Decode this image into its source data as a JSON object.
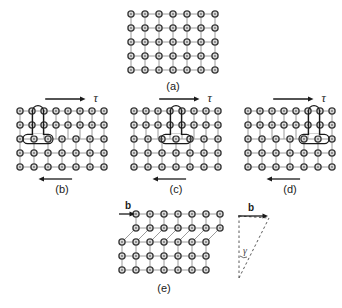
{
  "figure": {
    "background_color": "#ffffff",
    "atom_ring_color": "#3a3a3a",
    "atom_fill_color": "#d9d9d9",
    "bond_color": "#9a9a9a",
    "marker_color": "#1a1a1a",
    "label_color": "#1a1a1a"
  },
  "panels": [
    {
      "id": "a",
      "label": "(a)",
      "caption_label": "(a)",
      "description": "perfect-lattice",
      "origin": {
        "x": 131,
        "y": 14
      },
      "spacing": 14,
      "cols": 7,
      "rows": 5,
      "has_dislocation": false,
      "has_tau": false,
      "has_step": false
    },
    {
      "id": "b",
      "label": "(b)",
      "caption_label": "(b)",
      "description": "dislocation-at-left",
      "origin": {
        "x": 20,
        "y": 111
      },
      "spacing": 14,
      "cols": 7,
      "rows": 5,
      "has_dislocation": true,
      "dislocation_column": 1,
      "half_plane_top_row": 0,
      "half_plane_bottom_row": 2,
      "has_tau": true,
      "tau_symbol": "τ",
      "has_step": false
    },
    {
      "id": "c",
      "label": "(c)",
      "caption_label": "(c)",
      "description": "dislocation-at-center",
      "origin": {
        "x": 134,
        "y": 111
      },
      "spacing": 14,
      "cols": 7,
      "rows": 5,
      "has_dislocation": true,
      "dislocation_column": 3,
      "half_plane_top_row": 0,
      "half_plane_bottom_row": 2,
      "has_tau": true,
      "tau_symbol": "τ",
      "has_step": false
    },
    {
      "id": "d",
      "label": "(d)",
      "caption_label": "(d)",
      "description": "dislocation-at-right",
      "origin": {
        "x": 248,
        "y": 111
      },
      "spacing": 14,
      "cols": 7,
      "rows": 5,
      "has_dislocation": true,
      "dislocation_column": 5,
      "half_plane_top_row": 0,
      "half_plane_bottom_row": 2,
      "has_tau": true,
      "tau_symbol": "τ",
      "has_step": false
    },
    {
      "id": "e",
      "label": "(e)",
      "caption_label": "(e)",
      "description": "slipped-crystal-with-step",
      "origin": {
        "x": 122,
        "y": 214
      },
      "spacing": 14,
      "cols": 7,
      "rows": 5,
      "has_dislocation": false,
      "has_tau": false,
      "has_step": true,
      "step_offset_rows": 2,
      "burgers_symbol": "b"
    }
  ],
  "annotations": {
    "tau_symbol": "τ",
    "burgers_symbol": "b",
    "shear_angle_symbol": "γ",
    "top_arrow_direction": "right",
    "bottom_arrow_direction": "left"
  },
  "shear_inset": {
    "name": "shear-strain-inset",
    "burgers_label": "b",
    "angle_label": "γ",
    "origin": {
      "x": 239,
      "y": 216
    },
    "width": 30,
    "height": 62,
    "style": "dashed-triangle"
  }
}
